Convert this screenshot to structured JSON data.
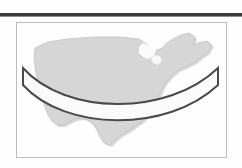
{
  "figure": {
    "caption": "",
    "frame": {
      "border_color": "#bdbdbd",
      "background_color": "#fefefe"
    },
    "page_rule": {
      "name": "top-rule",
      "color": "#3b3b3b"
    },
    "map": {
      "region_label": "United States",
      "fill_color": "#d6d6d6",
      "outline_color": "#c2c2c2",
      "shadow_color": "#b4b4b4"
    },
    "band": {
      "label": "path band",
      "stroke_color": "#4a4a4a",
      "fill_color": "#fbfbfb",
      "stroke_width": 2,
      "shape": "arc",
      "left_cap_x": 6,
      "right_cap_x": 201
    }
  }
}
